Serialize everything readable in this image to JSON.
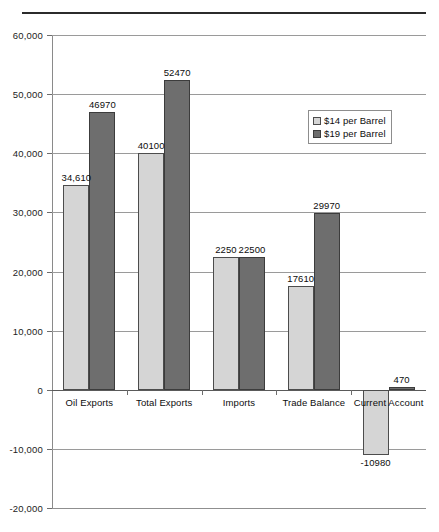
{
  "chart_data": {
    "type": "bar",
    "title": "",
    "xlabel": "",
    "ylabel": "",
    "categories": [
      "Oil Exports",
      "Total Exports",
      "Imports",
      "Trade Balance",
      "Current Account"
    ],
    "series": [
      {
        "name": "$14 per Barrel",
        "color": "#d5d5d5",
        "values": [
          34610,
          40100,
          22500,
          17610,
          -10980
        ],
        "labels": [
          "34,610",
          "40100",
          "2250",
          "17610",
          "-10980"
        ]
      },
      {
        "name": "$19 per Barrel",
        "color": "#6e6e6e",
        "values": [
          46970,
          52470,
          22500,
          29970,
          470
        ],
        "labels": [
          "46970",
          "52470",
          "22500",
          "29970",
          "470"
        ]
      }
    ],
    "ylim": [
      -20000,
      60000
    ],
    "yticks": [
      60000,
      50000,
      40000,
      30000,
      20000,
      10000,
      0,
      -10000,
      -20000
    ],
    "ytick_labels": [
      "60,000",
      "50,000",
      "40,000",
      "30,000",
      "20,000",
      "10,000",
      "0",
      "-10,000",
      "-20,000"
    ],
    "grid": true,
    "legend_position": "upper right"
  },
  "legend": {
    "entries": [
      {
        "label": "$14 per Barrel"
      },
      {
        "label": "$19 per Barrel"
      }
    ]
  }
}
